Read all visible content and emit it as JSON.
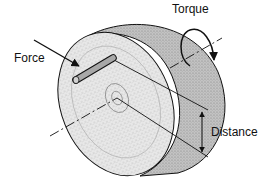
{
  "diagram": {
    "labels": {
      "force": "Force",
      "torque": "Torque",
      "distance": "Distance"
    },
    "elements": {
      "disk": "wheel-disk",
      "pin": "pin-on-disk",
      "axis": "rotation-axis-dashed",
      "force_arrow": "force-arrow",
      "torque_arrow": "curved-rotation-arrow",
      "distance_arrow": "double-headed-distance-arrow"
    },
    "colors": {
      "line": "#111111",
      "disk_face": "#e6e6e6",
      "disk_rim": "#bdbdbd",
      "pin": "#a8a8a8",
      "background": "#ffffff"
    }
  }
}
